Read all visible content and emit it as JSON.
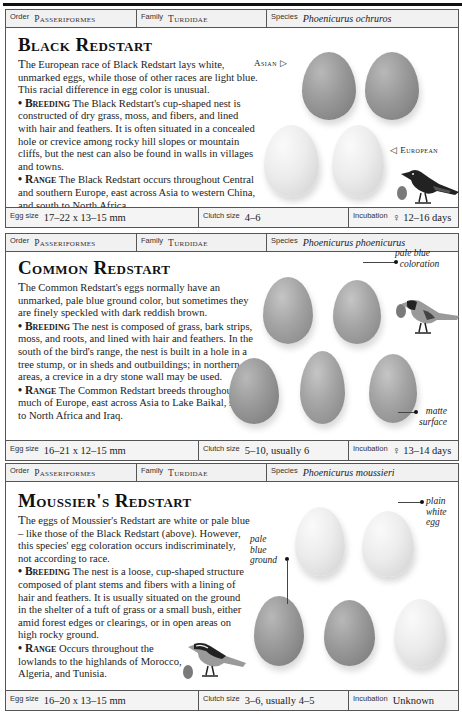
{
  "labels": {
    "order": "Order",
    "family": "Family",
    "species": "Species",
    "egg_size": "Egg size",
    "clutch_size": "Clutch size",
    "incubation": "Incubation"
  },
  "entries": [
    {
      "order": "Passeriformes",
      "family": "Turdidae",
      "species": "Phoenicurus ochruros",
      "title": "Black Redstart",
      "intro_first": "T",
      "intro": "he European race of Black Redstart lays white, unmarked eggs, while those of other races are light blue. This racial difference in egg color is unusual.",
      "breeding_label": "• Breeding",
      "breeding": " The Black Redstart's cup-shaped nest is constructed of dry grass, moss, and fibers, and lined with hair and feathers. It is often situated in a concealed hole or crevice among rocky hill slopes or mountain cliffs, but the nest can also be found in walls in villages and towns.",
      "range_label": "• Range",
      "range": " The Black Redstart occurs throughout Central and southern Europe, east across Asia to western China, and south to North Africa.",
      "annotations": {
        "asian": "Asian ▷",
        "european": "◁ European"
      },
      "egg_size": "17–22 x 13–15 mm",
      "clutch_size": "4–6",
      "incubation": "♀ 12–16 days"
    },
    {
      "order": "Passeriformes",
      "family": "Turdidae",
      "species": "Phoenicurus phoenicurus",
      "title": "Common Redstart",
      "intro_first": "T",
      "intro": "he Common Redstart's eggs normally have an unmarked, pale blue ground color, but sometimes they are finely speckled with dark reddish brown.",
      "breeding_label": "• Breeding",
      "breeding": " The nest is composed of grass, bark strips, moss, and roots, and lined with hair and feathers. In the south of the bird's range, the nest is built in a hole in a tree stump, or in sheds and outbuildings; in northern areas, a crevice in a dry stone wall may be used.",
      "range_label": "• Range",
      "range": " The Common Redstart breeds throughout much of Europe, east across Asia to Lake Baikal, south to North Africa and Iraq.",
      "annotations": {
        "pale_blue_1": "pale blue",
        "pale_blue_2": "coloration",
        "matte_1": "matte",
        "matte_2": "surface"
      },
      "egg_size": "16–21 x 12–15 mm",
      "clutch_size": "5–10, usually 6",
      "incubation": "♀ 13–14 days"
    },
    {
      "order": "Passeriformes",
      "family": "Turdidae",
      "species": "Phoenicurus moussieri",
      "title": "Moussier's Redstart",
      "intro_first": "T",
      "intro": "he eggs of Moussier's Redstart are white or pale blue – like those of the Black Redstart (above). However, this species' egg coloration occurs indiscriminately, not according to race.",
      "breeding_label": "• Breeding",
      "breeding": " The nest is a loose, cup-shaped structure composed of plant stems and fibers with a lining of hair and feathers. It is usually situated on the ground in the shelter of a tuft of grass or a small bush, either amid forest edges or clearings, or in open areas on high rocky ground.",
      "range_label": "• Range",
      "range": " Occurs throughout the lowlands to the highlands of Morocco, Algeria, and Tunisia.",
      "annotations": {
        "plain_1": "plain",
        "plain_2": "white",
        "plain_3": "egg",
        "pale_1": "pale",
        "pale_2": "blue",
        "pale_3": "ground"
      },
      "egg_size": "16–20 x 13–15 mm",
      "clutch_size": "3–6, usually 4–5",
      "incubation": "Unknown"
    }
  ]
}
